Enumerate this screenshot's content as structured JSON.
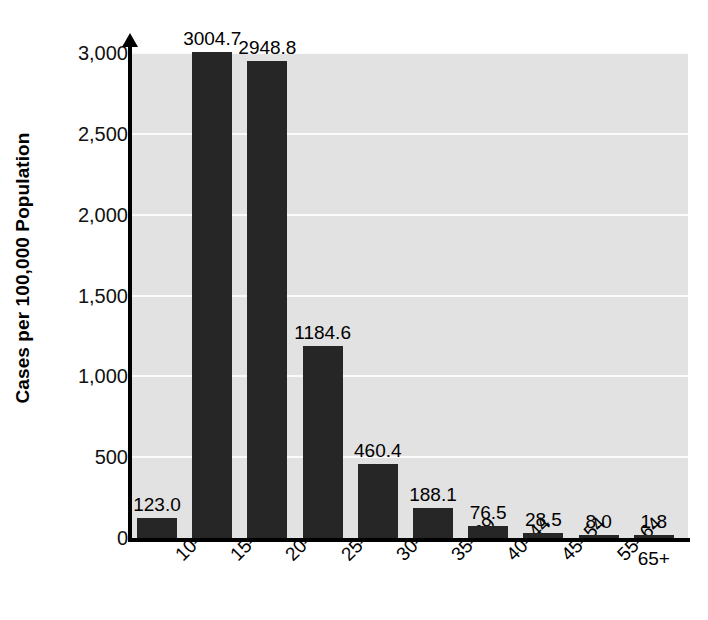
{
  "chart_data": {
    "type": "bar",
    "title": "",
    "subtitle": "",
    "xlabel": "",
    "ylabel": "Cases per 100,000 Population",
    "categories": [
      "10–14",
      "15–19",
      "20–24",
      "25–29",
      "30–34",
      "35–39",
      "40–44",
      "45–54",
      "55–64",
      "65+"
    ],
    "values": [
      123.0,
      3004.7,
      2948.8,
      1184.6,
      460.4,
      188.1,
      76.5,
      28.5,
      8.0,
      1.8
    ],
    "value_labels": [
      "123.0",
      "3004.7",
      "2948.8",
      "1184.6",
      "460.4",
      "188.1",
      "76.5",
      "28.5",
      "8.0",
      "1.8"
    ],
    "ylim": [
      0,
      3000
    ],
    "yticks": [
      0,
      500,
      1000,
      1500,
      2000,
      2500,
      3000
    ],
    "ytick_labels": [
      "0",
      "500",
      "1,000",
      "1,500",
      "2,000",
      "2,500",
      "3,000"
    ],
    "grid": true,
    "grid_axis": "y",
    "legend": null,
    "bar_color": "#262626",
    "plot_background": "#e2e2e2",
    "gridline_color": "#fbfbfb",
    "axis_color": "#000000",
    "figure_background": "#ffffff",
    "xtick_rotation_deg": -45,
    "last_xtick_rotation_deg": 0
  },
  "figure": {
    "width": 708,
    "height": 620
  }
}
